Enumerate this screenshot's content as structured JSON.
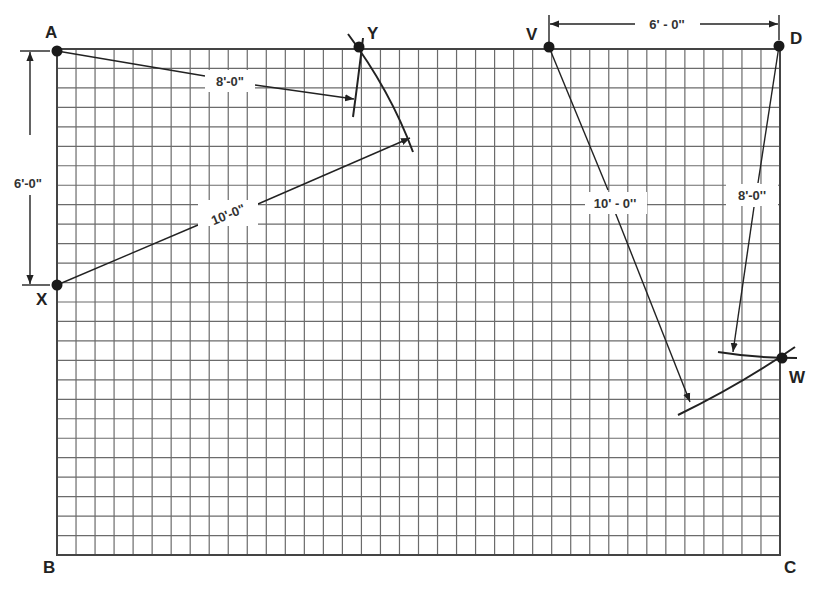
{
  "diagram": {
    "grid": {
      "left": 57,
      "top": 49,
      "right": 780,
      "bottom": 555,
      "columns": 38,
      "rows": 26,
      "line_color": "#6b6b6b",
      "cell_represents": "6 in"
    },
    "points": {
      "A": {
        "label": "A",
        "x": 57,
        "y": 51
      },
      "X": {
        "label": "X",
        "x": 57,
        "y": 285
      },
      "Y": {
        "label": "Y",
        "x": 359,
        "y": 47
      },
      "V": {
        "label": "V",
        "x": 549,
        "y": 47
      },
      "D": {
        "label": "D",
        "x": 779,
        "y": 46
      },
      "W": {
        "label": "W",
        "x": 782,
        "y": 358
      }
    },
    "corner_labels": {
      "B": "B",
      "C": "C"
    },
    "dimensions": {
      "ax_vertical": "6'-0\"",
      "a_to_y": "8'-0\"",
      "x_to_y": "10'-0\"",
      "v_to_d": "6' - 0''",
      "v_to_w": "10' - 0''",
      "d_to_w": "8'-0''"
    }
  }
}
